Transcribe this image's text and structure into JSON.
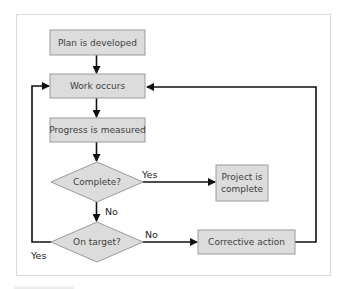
{
  "diagram": {
    "type": "flowchart",
    "colors": {
      "node_fill": "#dcdcdc",
      "node_border": "#9a9a9a",
      "node_text": "#3f3f3f",
      "edge": "#111111",
      "frame_border": "#d8d8d8"
    },
    "nodes": {
      "plan": {
        "label": "Plan is developed",
        "shape": "rect"
      },
      "work": {
        "label": "Work occurs",
        "shape": "rect"
      },
      "progress": {
        "label": "Progress is measured",
        "shape": "rect"
      },
      "complete_q": {
        "label": "Complete?",
        "shape": "diamond"
      },
      "project_done_line1": {
        "label": "Project is",
        "shape": "rect"
      },
      "project_done_line2": {
        "label": "complete",
        "shape": "rect"
      },
      "on_target_q": {
        "label": "On target?",
        "shape": "diamond"
      },
      "corrective": {
        "label": "Corrective action",
        "shape": "rect"
      }
    },
    "edges": [
      {
        "from": "Plan is developed",
        "to": "Work occurs",
        "label": ""
      },
      {
        "from": "Work occurs",
        "to": "Progress is measured",
        "label": ""
      },
      {
        "from": "Progress is measured",
        "to": "Complete?",
        "label": ""
      },
      {
        "from": "Complete?",
        "to": "Project is complete",
        "label": "Yes"
      },
      {
        "from": "Complete?",
        "to": "On target?",
        "label": "No"
      },
      {
        "from": "On target?",
        "to": "Corrective action",
        "label": "No"
      },
      {
        "from": "On target?",
        "to": "Work occurs",
        "label": "Yes"
      },
      {
        "from": "Corrective action",
        "to": "Work occurs",
        "label": ""
      }
    ],
    "edge_labels": {
      "complete_yes": "Yes",
      "complete_no": "No",
      "ontarget_no": "No",
      "ontarget_yes": "Yes"
    }
  }
}
